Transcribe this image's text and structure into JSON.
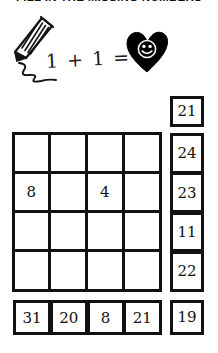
{
  "worksheet": {
    "title": "FILL IN THE MISSING NUMBERS",
    "equation": "1 + 1 =",
    "answer_icon": "heart-smiley-icon",
    "pencil_icon": "pencil-icon"
  },
  "colors": {
    "ink": "#111111",
    "paper": "#ffffff",
    "heart": "#000000"
  },
  "grid": {
    "rows": 4,
    "cols": 4,
    "cells": [
      [
        "",
        "",
        "",
        ""
      ],
      [
        "8",
        "",
        "4",
        ""
      ],
      [
        "",
        "",
        "",
        ""
      ],
      [
        "",
        "",
        "",
        ""
      ]
    ]
  },
  "answer_column": {
    "top_box": "21",
    "stack": [
      "24",
      "23",
      "11",
      "22"
    ],
    "bottom_box": "19"
  },
  "bottom_row": {
    "boxes": [
      "31",
      "20",
      "8",
      "21"
    ]
  }
}
